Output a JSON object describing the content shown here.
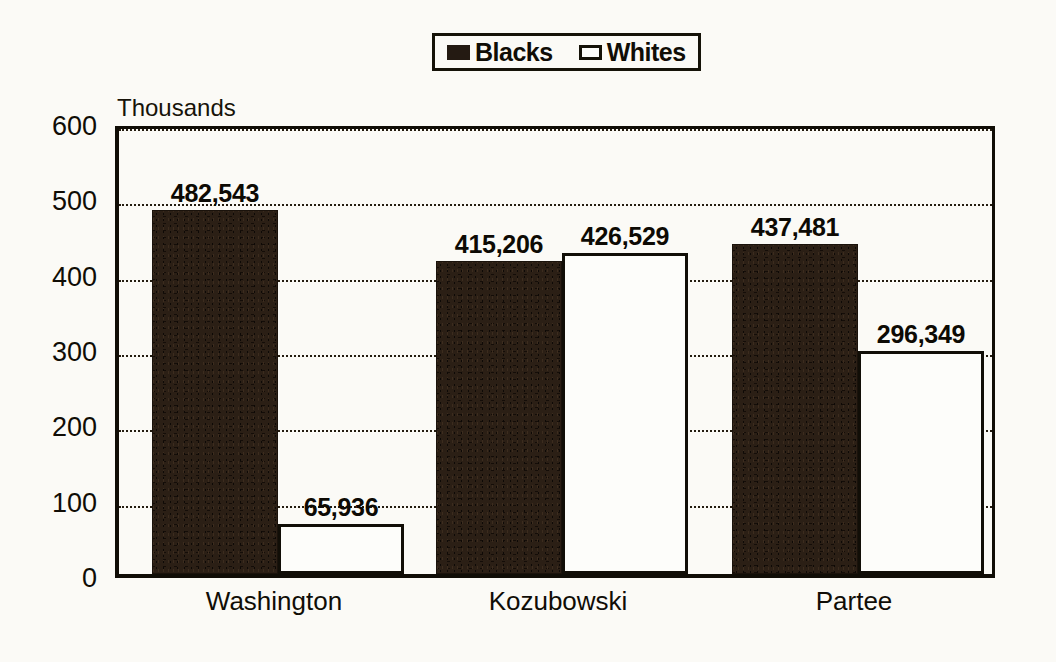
{
  "chart_data": {
    "type": "bar",
    "title": "",
    "subtitle": "",
    "xlabel": "",
    "ylabel": "Thousands",
    "unit_caption": "Thousands",
    "categories": [
      "Washington",
      "Kozubowski",
      "Partee"
    ],
    "series": [
      {
        "name": "Blacks",
        "color": "#241a12",
        "values": [
          482543,
          415206,
          437481
        ],
        "labels": [
          "482,543",
          "415,206",
          "437,481"
        ]
      },
      {
        "name": "Whites",
        "color": "#fdfdfa",
        "values": [
          65936,
          426529,
          296349
        ],
        "labels": [
          "65,936",
          "426,529",
          "296,349"
        ]
      }
    ],
    "y_ticks": [
      0,
      100,
      200,
      300,
      400,
      500,
      600
    ],
    "y_tick_labels": [
      "0",
      "100",
      "200",
      "300",
      "400",
      "500",
      "600"
    ],
    "ylim": [
      0,
      600
    ],
    "y_scale_note": "values plotted in thousands",
    "grid": "horizontal-dotted",
    "legend_position": "top-center",
    "legend_entries": [
      "Blacks",
      "Whites"
    ]
  },
  "legend": {
    "entries": [
      {
        "label": "Blacks",
        "swatch": "filled-dark-square-icon"
      },
      {
        "label": "Whites",
        "swatch": "hollow-square-icon"
      }
    ]
  },
  "colors": {
    "background": "#fbfaf6",
    "ink": "#100d06",
    "bar_dark": "#241a12",
    "bar_light": "#fdfdfa"
  }
}
